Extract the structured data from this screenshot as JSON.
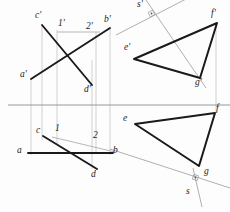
{
  "diagram": {
    "colors": {
      "heavy_line": "#1a1a1a",
      "thin_line": "#9a9a9a",
      "ground_line": "#8d8d8d",
      "projector": "#b0b0b0",
      "background": "#fdfdfd"
    },
    "ground_line": {
      "name": "ground-line",
      "y": 105,
      "x1": 0,
      "x2": 230
    },
    "labels": [
      {
        "id": "c-prime",
        "text": "c'",
        "x": 37,
        "y": 14
      },
      {
        "id": "one-prime",
        "text": "1'",
        "x": 60,
        "y": 22
      },
      {
        "id": "two-prime",
        "text": "2'",
        "x": 88,
        "y": 25
      },
      {
        "id": "b-prime",
        "text": "b'",
        "x": 105,
        "y": 18
      },
      {
        "id": "a-prime",
        "text": "a'",
        "x": 22,
        "y": 71
      },
      {
        "id": "d-prime",
        "text": "d'",
        "x": 85,
        "y": 86
      },
      {
        "id": "c",
        "text": "c",
        "x": 37,
        "y": 128
      },
      {
        "id": "one",
        "text": "1",
        "x": 56,
        "y": 126
      },
      {
        "id": "two",
        "text": "2",
        "x": 94,
        "y": 133
      },
      {
        "id": "a",
        "text": "a",
        "x": 18,
        "y": 148
      },
      {
        "id": "b",
        "text": "b",
        "x": 112,
        "y": 148
      },
      {
        "id": "d",
        "text": "d",
        "x": 92,
        "y": 172
      },
      {
        "id": "s-prime",
        "text": "s'",
        "x": 139,
        "y": 1
      },
      {
        "id": "e-prime",
        "text": "e'",
        "x": 126,
        "y": 44
      },
      {
        "id": "f-prime",
        "text": "f'",
        "x": 212,
        "y": 10
      },
      {
        "id": "g-prime",
        "text": "g'",
        "x": 197,
        "y": 78
      },
      {
        "id": "e",
        "text": "e",
        "x": 124,
        "y": 116
      },
      {
        "id": "f",
        "text": "f",
        "x": 216,
        "y": 108
      },
      {
        "id": "g",
        "text": "g",
        "x": 205,
        "y": 170
      },
      {
        "id": "s",
        "text": "s",
        "x": 188,
        "y": 190
      }
    ],
    "heavy_segments": [
      {
        "name": "segment-c-prime-d-prime",
        "x1": 42,
        "y1": 25,
        "x2": 92,
        "y2": 85
      },
      {
        "name": "segment-a-prime-b-prime",
        "x1": 31,
        "y1": 79,
        "x2": 110,
        "y2": 28
      },
      {
        "name": "segment-c-d",
        "x1": 43,
        "y1": 136,
        "x2": 97,
        "y2": 169
      },
      {
        "name": "segment-a-b",
        "x1": 28,
        "y1": 153,
        "x2": 113,
        "y2": 153
      }
    ],
    "triangles": [
      {
        "name": "triangle-efg-front",
        "points": "134,59 217,23 200,78",
        "vertices": [
          {
            "id": "e-prime",
            "x": 134,
            "y": 59
          },
          {
            "id": "f-prime",
            "x": 217,
            "y": 23
          },
          {
            "id": "g-prime",
            "x": 200,
            "y": 78
          }
        ]
      },
      {
        "name": "triangle-efg-top",
        "points": "135,124 215,113 199,166",
        "vertices": [
          {
            "id": "e",
            "x": 135,
            "y": 124
          },
          {
            "id": "f",
            "x": 215,
            "y": 113
          },
          {
            "id": "g",
            "x": 199,
            "y": 166
          }
        ]
      }
    ],
    "thin_lines": [
      {
        "name": "chord-one-prime-two-prime",
        "x1": 57,
        "y1": 32,
        "x2": 96,
        "y2": 32
      },
      {
        "name": "chord-one-two",
        "x1": 54,
        "y1": 137,
        "x2": 113,
        "y2": 151
      },
      {
        "name": "axis-s-prime",
        "x1": 117,
        "y1": 34,
        "x2": 186,
        "y2": 0
      },
      {
        "name": "ray-s-prime-through-g",
        "x1": 147,
        "y1": 0,
        "x2": 205,
        "y2": 85
      },
      {
        "name": "axis-s",
        "x1": 113,
        "y1": 150,
        "x2": 230,
        "y2": 188
      },
      {
        "name": "ray-s-tick",
        "x1": 196,
        "y1": 170,
        "x2": 203,
        "y2": 205
      }
    ],
    "projectors": [
      {
        "name": "projector-c",
        "x": 42,
        "y1": 25,
        "y2": 140
      },
      {
        "name": "projector-one",
        "x": 57,
        "y1": 32,
        "y2": 145
      },
      {
        "name": "projector-a",
        "x": 31,
        "y1": 79,
        "y2": 153
      },
      {
        "name": "projector-two",
        "x": 96,
        "y1": 32,
        "y2": 152
      },
      {
        "name": "projector-d",
        "x": 92,
        "y1": 85,
        "y2": 169
      },
      {
        "name": "projector-b",
        "x": 110,
        "y1": 28,
        "y2": 153
      },
      {
        "name": "projector-f",
        "x": 216,
        "y1": 23,
        "y2": 113
      }
    ],
    "right_angle_marks": [
      {
        "name": "right-angle-mark-s-prime",
        "x": 152,
        "y": 14
      },
      {
        "name": "right-angle-mark-s",
        "x": 196,
        "y": 178
      }
    ]
  }
}
